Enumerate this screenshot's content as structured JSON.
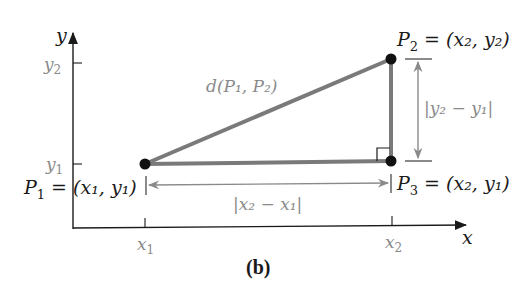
{
  "figure": {
    "caption": "(b)",
    "axes": {
      "x_label": "x",
      "y_label": "y",
      "x_ticks": [
        {
          "main": "x",
          "sub": "1"
        },
        {
          "main": "x",
          "sub": "2"
        }
      ],
      "y_ticks": [
        {
          "main": "y",
          "sub": "2"
        },
        {
          "main": "y",
          "sub": "1"
        }
      ]
    },
    "points": {
      "p1": {
        "name": "P",
        "sub": "1",
        "eq": " = ",
        "coords": "(x₁, y₁)"
      },
      "p2": {
        "name": "P",
        "sub": "2",
        "eq": " = ",
        "coords": "(x₂, y₂)"
      },
      "p3": {
        "name": "P",
        "sub": "3",
        "eq": " = ",
        "coords": "(x₂, y₁)"
      }
    },
    "labels": {
      "distance": "d(P₁, P₂)",
      "horizontal_distance": "|x₂ − x₁|",
      "vertical_distance": "|y₂ − y₁|"
    },
    "colors": {
      "triangle_stroke": "#7a7a7a",
      "axis": "#1a1a1a",
      "dimension": "#8a8a8a",
      "point": "#111111"
    }
  }
}
